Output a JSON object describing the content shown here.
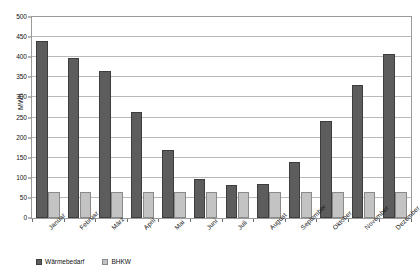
{
  "chart_data": {
    "type": "bar",
    "title": "",
    "subtitle": "",
    "xlabel": "",
    "ylabel": "MWh",
    "ylim": [
      0,
      500
    ],
    "ytick_step": 50,
    "yticks": [
      0,
      50,
      100,
      150,
      200,
      250,
      300,
      350,
      400,
      450,
      500
    ],
    "grid": true,
    "legend_position": "bottom-left",
    "categories": [
      "Januar",
      "Februar",
      "März",
      "April",
      "Mai",
      "Juni",
      "Juli",
      "August",
      "September",
      "Oktober",
      "November",
      "Dezember"
    ],
    "series": [
      {
        "name": "Wärmebedarf",
        "color": "#5d5d5d",
        "values": [
          441,
          399,
          365,
          263,
          168,
          98,
          81,
          84,
          140,
          241,
          330,
          409
        ]
      },
      {
        "name": "BHKW",
        "color": "#c3c3c3",
        "values": [
          64,
          64,
          64,
          64,
          64,
          64,
          64,
          64,
          64,
          64,
          64,
          64
        ]
      }
    ]
  },
  "legend": {
    "items": [
      {
        "label": "Wärmebedarf"
      },
      {
        "label": "BHKW"
      }
    ]
  },
  "axes": {
    "y_title": "MWh"
  }
}
